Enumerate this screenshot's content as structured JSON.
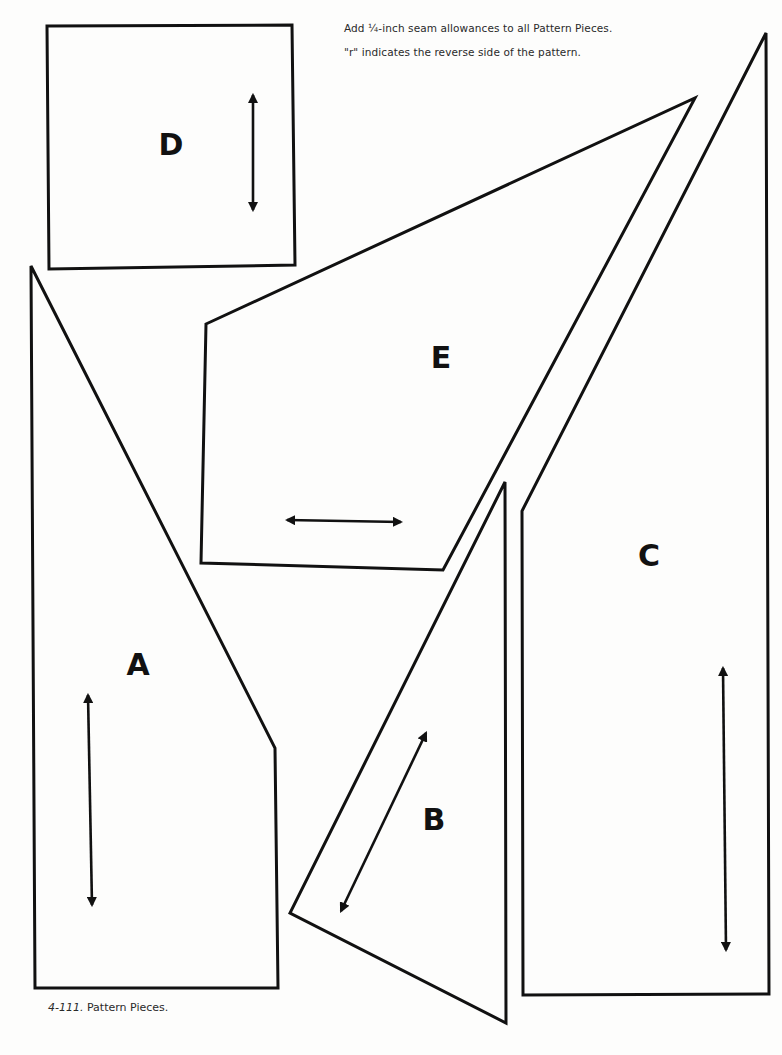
{
  "notes": {
    "seam_allowance": "Add ¼-inch seam allowances to all Pattern Pieces.",
    "reverse_side": "\"r\" indicates the reverse side of the pattern."
  },
  "caption": {
    "figure_number": "4-111.",
    "text": "Pattern Pieces."
  },
  "pieces": [
    {
      "id": "A",
      "label": "A",
      "grainline": "vertical"
    },
    {
      "id": "B",
      "label": "B",
      "grainline": "diagonal"
    },
    {
      "id": "C",
      "label": "C",
      "grainline": "vertical"
    },
    {
      "id": "D",
      "label": "D",
      "grainline": "vertical"
    },
    {
      "id": "E",
      "label": "E",
      "grainline": "horizontal"
    }
  ],
  "colors": {
    "line": "#111111",
    "background": "#fdfdfc"
  }
}
